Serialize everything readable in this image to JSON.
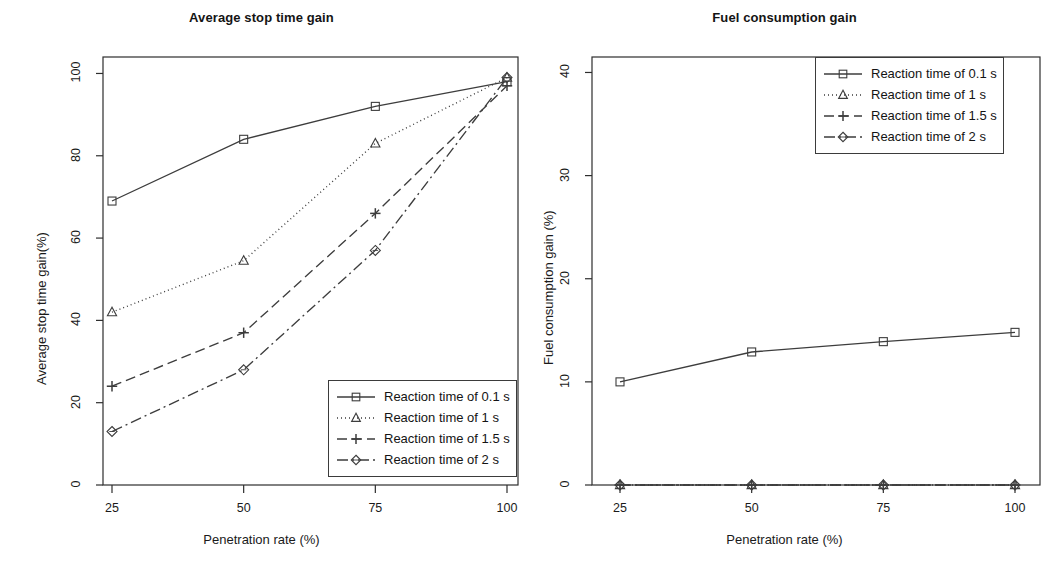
{
  "figure": {
    "panels": [
      {
        "title": "Average stop time gain",
        "xlabel": "Penetration rate (%)",
        "ylabel": "Average stop time gain(%)",
        "xticks": [
          "25",
          "50",
          "75",
          "100"
        ],
        "yticks": [
          "0",
          "20",
          "40",
          "60",
          "80",
          "100"
        ]
      },
      {
        "title": "Fuel consumption gain",
        "xlabel": "Penetration rate (%)",
        "ylabel": "Fuel consumption gain (%)",
        "xticks": [
          "25",
          "50",
          "75",
          "100"
        ],
        "yticks": [
          "0",
          "10",
          "20",
          "30",
          "40"
        ]
      }
    ],
    "legend": {
      "entries": [
        {
          "label": "Reaction time of 0.1 s",
          "marker": "square-marker",
          "dash": "solid"
        },
        {
          "label": "Reaction time of 1 s",
          "marker": "triangle-marker",
          "dash": "dotted"
        },
        {
          "label": "Reaction time of 1.5 s",
          "marker": "plus-marker",
          "dash": "dashed"
        },
        {
          "label": "Reaction time of 2 s",
          "marker": "diamond-marker",
          "dash": "dashdot"
        }
      ]
    },
    "line_color": "#3d3d3d"
  },
  "chart_data": [
    {
      "type": "line",
      "title": "Average stop time gain",
      "xlabel": "Penetration rate (%)",
      "ylabel": "Average stop time gain(%)",
      "categories": [
        25,
        50,
        75,
        100
      ],
      "xlim": [
        18,
        107
      ],
      "ylim": [
        0,
        104
      ],
      "grid": false,
      "legend_position": "bottom-right",
      "series": [
        {
          "name": "Reaction time of 0.1 s",
          "marker": "square",
          "dash": "solid",
          "values": [
            69,
            84,
            92,
            98
          ]
        },
        {
          "name": "Reaction time of 1 s",
          "marker": "triangle",
          "dash": "dotted",
          "values": [
            42,
            54.5,
            83,
            99
          ]
        },
        {
          "name": "Reaction time of 1.5 s",
          "marker": "plus",
          "dash": "dashed",
          "values": [
            24,
            37,
            66,
            97
          ]
        },
        {
          "name": "Reaction time of 2 s",
          "marker": "diamond",
          "dash": "dashdot",
          "values": [
            13,
            28,
            57,
            99
          ]
        }
      ]
    },
    {
      "type": "line",
      "title": "Fuel consumption gain",
      "xlabel": "Penetration rate (%)",
      "ylabel": "Fuel consumption gain (%)",
      "categories": [
        25,
        50,
        75,
        100
      ],
      "xlim": [
        18,
        107
      ],
      "ylim": [
        0,
        41.5
      ],
      "grid": false,
      "legend_position": "top-right",
      "series": [
        {
          "name": "Reaction time of 0.1 s",
          "marker": "square",
          "dash": "solid",
          "values": [
            10.0,
            12.9,
            13.9,
            14.8
          ]
        },
        {
          "name": "Reaction time of 1 s",
          "marker": "triangle",
          "dash": "dotted",
          "values": [
            0,
            0,
            0,
            0
          ]
        },
        {
          "name": "Reaction time of 1.5 s",
          "marker": "plus",
          "dash": "dashed",
          "values": [
            0,
            0,
            0,
            0
          ]
        },
        {
          "name": "Reaction time of 2 s",
          "marker": "diamond",
          "dash": "dashdot",
          "values": [
            0,
            0,
            0,
            0
          ]
        }
      ]
    }
  ]
}
